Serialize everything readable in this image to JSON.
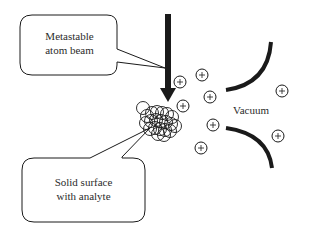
{
  "diagram": {
    "type": "metastable atom beam ionization schematic",
    "labels": {
      "beam_line1": "Metastable",
      "beam_line2": "atom beam",
      "surface_line1": "Solid surface",
      "surface_line2": "with analyte",
      "vacuum": "Vacuum"
    },
    "ion_symbol": "+",
    "colors": {
      "stroke": "#1a1a1a",
      "text": "#2b2b2b",
      "background": "#ffffff"
    }
  }
}
